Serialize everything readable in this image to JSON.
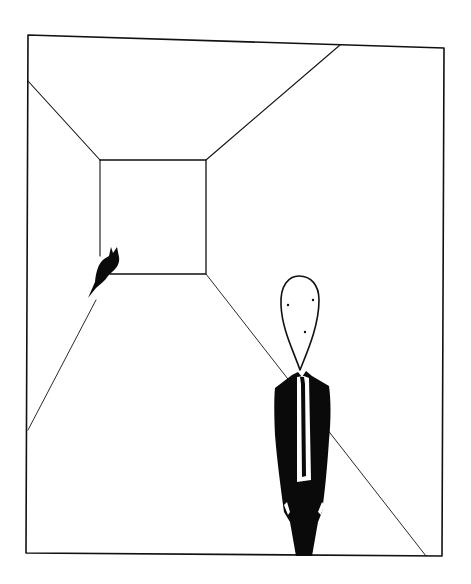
{
  "illustration": {
    "description": "Ink drawing: a room in one-point perspective, a small black cat on the left floor line, a tall figure in a black suit with white tie on the right",
    "colors": {
      "background": "#ffffff",
      "ink": "#111111",
      "fill": "#0a0a0a"
    },
    "frame": {
      "points": "28,35 444,48 442,556 26,553"
    },
    "back_wall": {
      "points": "100,160 206,160 206,274 110,274"
    },
    "perspective_lines": [
      {
        "name": "ceiling-left",
        "x1": 28,
        "y1": 81,
        "x2": 100,
        "y2": 160
      },
      {
        "name": "ceiling-right",
        "x1": 340,
        "y1": 45,
        "x2": 206,
        "y2": 160
      },
      {
        "name": "floor-right",
        "x1": 206,
        "y1": 274,
        "x2": 426,
        "y2": 556
      },
      {
        "name": "floor-left",
        "x1": 110,
        "y1": 274,
        "x2": 28,
        "y2": 430
      },
      {
        "name": "back-wall-left-edge",
        "x1": 100,
        "y1": 160,
        "x2": 100,
        "y2": 256
      }
    ],
    "cat": {
      "label": "cat silhouette"
    },
    "figure": {
      "label": "tall faceless man in black suit",
      "eyes": [
        {
          "cx": 288,
          "cy": 305
        },
        {
          "cx": 313,
          "cy": 300
        }
      ],
      "nose": {
        "cx": 305,
        "cy": 332
      }
    }
  }
}
